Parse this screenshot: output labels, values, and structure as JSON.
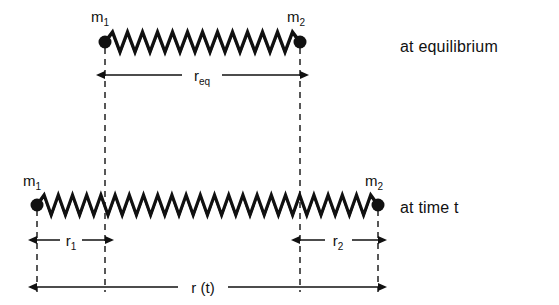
{
  "figure": {
    "background_color": "#ffffff",
    "ink_color": "#111111"
  },
  "rows": [
    {
      "id": "equilibrium-row",
      "caption": "at equilibrium",
      "left_mass": {
        "label": "m",
        "subscript": "1"
      },
      "right_mass": {
        "label": "m",
        "subscript": "2"
      },
      "spring": {
        "coils": 13,
        "x_start": 105,
        "x_end": 300,
        "y": 42
      },
      "dimension": {
        "label": "r",
        "subscript": "eq",
        "from": 105,
        "to": 300,
        "y": 75
      }
    },
    {
      "id": "time-t-row",
      "caption": "at time t",
      "left_mass": {
        "label": "m",
        "subscript": "1"
      },
      "right_mass": {
        "label": "m",
        "subscript": "2"
      },
      "spring": {
        "coils": 24,
        "x_start": 37,
        "x_end": 378,
        "y": 205
      },
      "dimensions": [
        {
          "label": "r",
          "subscript": "1",
          "from": 37,
          "to": 105,
          "y": 240
        },
        {
          "label": "r",
          "subscript": "2",
          "from": 300,
          "to": 378,
          "y": 240
        },
        {
          "label": "r (t)",
          "subscript": "",
          "from": 37,
          "to": 378,
          "y": 287
        }
      ]
    }
  ],
  "dashed_guides": [
    {
      "x": 37,
      "y_top": 210,
      "y_bottom": 292
    },
    {
      "x": 105,
      "y_top": 48,
      "y_bottom": 292
    },
    {
      "x": 300,
      "y_top": 48,
      "y_bottom": 292
    },
    {
      "x": 378,
      "y_top": 210,
      "y_bottom": 292
    }
  ]
}
